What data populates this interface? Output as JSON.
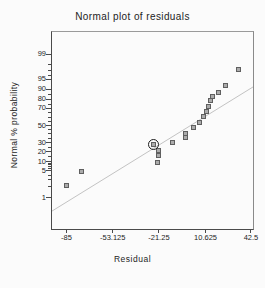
{
  "chart_data": {
    "type": "scatter",
    "title": "Normal plot of residuals",
    "xlabel": "Residual",
    "ylabel": "Normal % probability",
    "grid": false,
    "legend": "none",
    "x_axis": {
      "ticks": [
        {
          "label": "-85",
          "f": 0.077
        },
        {
          "label": "-53.125",
          "f": 0.307
        },
        {
          "label": "-21.25",
          "f": 0.537
        },
        {
          "label": "10.625",
          "f": 0.769
        },
        {
          "label": "42.5",
          "f": 0.995
        }
      ]
    },
    "y_axis": {
      "scale": "normal-probability",
      "ticks": [
        {
          "label": "99",
          "f": 0.117
        },
        {
          "label": "95",
          "f": 0.245
        },
        {
          "label": "90",
          "f": 0.296
        },
        {
          "label": "80",
          "f": 0.347
        },
        {
          "label": "70",
          "f": 0.392
        },
        {
          "label": "50",
          "f": 0.48
        },
        {
          "label": "30",
          "f": 0.567
        },
        {
          "label": "20",
          "f": 0.613
        },
        {
          "label": "10",
          "f": 0.664
        },
        {
          "label": "5",
          "f": 0.709
        },
        {
          "label": "1",
          "f": 0.846
        }
      ],
      "minor_tick_f": [
        0.168,
        0.201,
        0.225,
        0.324,
        0.371,
        0.416,
        0.438,
        0.459,
        0.501,
        0.522,
        0.544,
        0.589,
        0.635,
        0.671,
        0.679,
        0.688,
        0.698,
        0.731,
        0.756,
        0.791
      ]
    },
    "points": [
      {
        "residual": -85.0,
        "probability": 2.6,
        "fx": 0.078,
        "fy": 0.782,
        "highlighted": false
      },
      {
        "residual": -74.5,
        "probability": 7.9,
        "fx": 0.153,
        "fy": 0.714,
        "highlighted": false
      },
      {
        "residual": -22.5,
        "probability": 13.2,
        "fx": 0.529,
        "fy": 0.665,
        "highlighted": false
      },
      {
        "residual": -21.6,
        "probability": 18.4,
        "fx": 0.536,
        "fy": 0.631,
        "highlighted": false
      },
      {
        "residual": -21.6,
        "probability": 23.7,
        "fx": 0.536,
        "fy": 0.607,
        "highlighted": false
      },
      {
        "residual": -25.3,
        "probability": 28.9,
        "fx": 0.509,
        "fy": 0.575,
        "highlighted": true
      },
      {
        "residual": -12.4,
        "probability": 34.2,
        "fx": 0.602,
        "fy": 0.565,
        "highlighted": false
      },
      {
        "residual": -3.2,
        "probability": 39.5,
        "fx": 0.668,
        "fy": 0.543,
        "highlighted": false
      },
      {
        "residual": -3.2,
        "probability": 44.7,
        "fx": 0.668,
        "fy": 0.519,
        "highlighted": false
      },
      {
        "residual": 2.3,
        "probability": 50.0,
        "fx": 0.708,
        "fy": 0.492,
        "highlighted": false
      },
      {
        "residual": 6.6,
        "probability": 55.3,
        "fx": 0.739,
        "fy": 0.462,
        "highlighted": false
      },
      {
        "residual": 9.2,
        "probability": 60.5,
        "fx": 0.758,
        "fy": 0.435,
        "highlighted": false
      },
      {
        "residual": 11.5,
        "probability": 65.8,
        "fx": 0.775,
        "fy": 0.409,
        "highlighted": false
      },
      {
        "residual": 12.6,
        "probability": 71.1,
        "fx": 0.783,
        "fy": 0.383,
        "highlighted": false
      },
      {
        "residual": 14.1,
        "probability": 76.3,
        "fx": 0.794,
        "fy": 0.355,
        "highlighted": false
      },
      {
        "residual": 15.5,
        "probability": 81.6,
        "fx": 0.804,
        "fy": 0.335,
        "highlighted": false
      },
      {
        "residual": 19.5,
        "probability": 86.8,
        "fx": 0.832,
        "fy": 0.311,
        "highlighted": false
      },
      {
        "residual": 24.1,
        "probability": 92.1,
        "fx": 0.866,
        "fy": 0.276,
        "highlighted": false
      },
      {
        "residual": 33.6,
        "probability": 97.4,
        "fx": 0.934,
        "fy": 0.194,
        "highlighted": false
      }
    ],
    "fit_line": {
      "fy_at_left": 0.909,
      "fy_at_right": 0.279
    },
    "colors": {
      "background": "#fbfbfb",
      "point_fill": "#ababab",
      "point_border": "#5f5f5f",
      "highlight_ring": "#1c1c1c",
      "fit_line": "#c3c3c3",
      "axis": "#4a4a4a",
      "text": "#1d1d1d"
    }
  }
}
